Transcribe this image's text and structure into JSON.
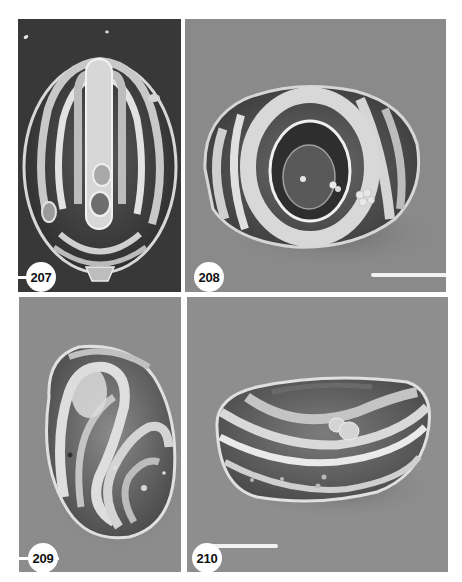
{
  "figure": {
    "type": "SEM micrograph plate",
    "panels": [
      {
        "id": "207",
        "label": "207",
        "background": "#383838",
        "scale_bar": false
      },
      {
        "id": "208",
        "label": "208",
        "background": "#8a8a8a",
        "scale_bar": true
      },
      {
        "id": "209",
        "label": "209",
        "background": "#8c8c8c",
        "scale_bar": false
      },
      {
        "id": "210",
        "label": "210",
        "background": "#8e8e8e",
        "scale_bar": true
      }
    ]
  }
}
